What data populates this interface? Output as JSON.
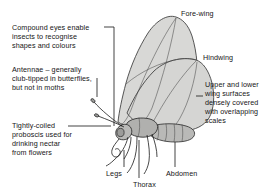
{
  "diagram": {
    "background_color": "#ffffff",
    "line_color": "#1a1a1a",
    "wing_fill_color": "#d8d8d6",
    "body_fill_color": "#b9b9b7",
    "labels": {
      "compound_eyes": "Compound eyes enable\ninsects to recognise\nshapes and colours",
      "antennae": "Antennae – generally\nclub-tipped in butterflies,\nbut not in moths",
      "proboscis": "Tightly-coiled\nproboscis used for\ndrinking nectar\nfrom flowers",
      "fore_wing": "Fore-wing",
      "hindwing": "Hindwing",
      "scales": "Upper and lower\nwing surfaces\ndensely covered\nwith overlapping\nscales",
      "legs": "Legs",
      "thorax": "Thorax",
      "abdomen": "Abdomen"
    }
  }
}
